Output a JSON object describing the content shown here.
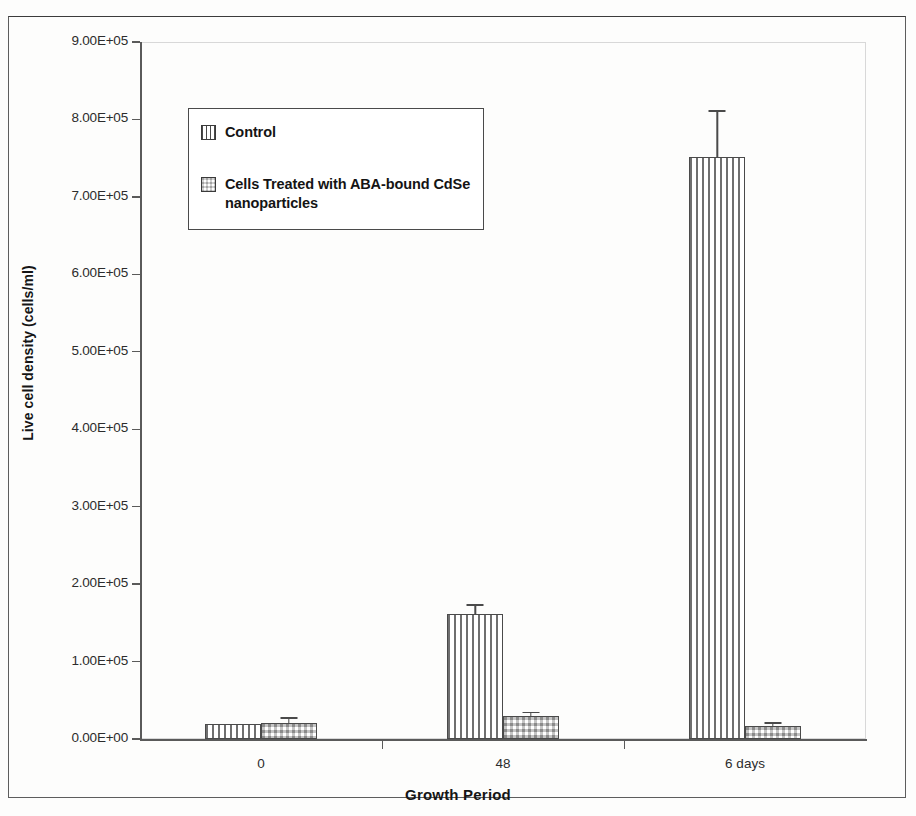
{
  "figure": {
    "background_color": "#fdfdfc",
    "frame_color": "#5d5d5d"
  },
  "legend": {
    "position": "upper-left-inside",
    "entries": [
      {
        "label": "Control",
        "swatch": "vertical-stripes-swatch",
        "color": "#6f6f6f"
      },
      {
        "label": "Cells Treated with ABA-bound CdSe nanoparticles",
        "swatch": "checkerboard-swatch",
        "color": "#3a3a3a"
      }
    ]
  },
  "chart_data": {
    "type": "bar",
    "title": "",
    "xlabel": "Growth Period",
    "ylabel": "Live cell density (cells/ml)",
    "categories": [
      "0",
      "48",
      "6 days"
    ],
    "ylim": [
      0,
      900000
    ],
    "ytick_values": [
      0,
      100000,
      200000,
      300000,
      400000,
      500000,
      600000,
      700000,
      800000,
      900000
    ],
    "ytick_labels": [
      "0.00E+00",
      "1.00E+05",
      "2.00E+05",
      "3.00E+05",
      "4.00E+05",
      "5.00E+05",
      "6.00E+05",
      "7.00E+05",
      "8.00E+05",
      "9.00E+05"
    ],
    "grid": false,
    "legend_position": "upper left",
    "series": [
      {
        "name": "Control",
        "pattern": "vertical-stripes",
        "values": [
          20000,
          162000,
          752000
        ],
        "errors": [
          0,
          12000,
          60000
        ]
      },
      {
        "name": "Cells Treated with ABA-bound CdSe nanoparticles",
        "pattern": "checkerboard",
        "values": [
          21000,
          30000,
          17000
        ],
        "errors": [
          7000,
          5000,
          5000
        ]
      }
    ]
  }
}
